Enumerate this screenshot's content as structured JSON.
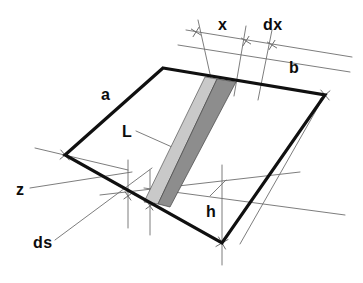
{
  "figure": {
    "kind": "geometry-diagram",
    "background_color": "#ffffff"
  },
  "colors": {
    "outline": "#101010",
    "guide_line": "#6e6e6e",
    "strip_light": "#c9c9c9",
    "strip_dark": "#8d8d8d",
    "label_text": "#0c0c0c"
  },
  "labels": [
    {
      "id": "x",
      "text": "x",
      "x": 218,
      "y": 17,
      "size": 16,
      "name": "label-x"
    },
    {
      "id": "dx",
      "text": "dx",
      "x": 263,
      "y": 17,
      "size": 16,
      "name": "label-dx"
    },
    {
      "id": "b",
      "text": "b",
      "x": 289,
      "y": 60,
      "size": 16,
      "name": "label-b"
    },
    {
      "id": "a",
      "text": "a",
      "x": 101,
      "y": 87,
      "size": 16,
      "name": "label-a"
    },
    {
      "id": "L",
      "text": "L",
      "x": 122,
      "y": 124,
      "size": 16,
      "name": "label-L"
    },
    {
      "id": "z",
      "text": "z",
      "x": 16,
      "y": 182,
      "size": 16,
      "name": "label-z"
    },
    {
      "id": "h",
      "text": "h",
      "x": 206,
      "y": 204,
      "size": 16,
      "name": "label-h"
    },
    {
      "id": "ds",
      "text": "ds",
      "x": 33,
      "y": 235,
      "size": 16,
      "name": "label-ds"
    }
  ],
  "geometry": {
    "parallelogram": {
      "name": "main-surface-parallelogram",
      "points": "163,68 325,95 222,243 65,155",
      "corners": {
        "top_left": [
          163,
          68
        ],
        "top_right": [
          325,
          95
        ],
        "bottom_right": [
          222,
          243
        ],
        "bottom_left": [
          65,
          155
        ]
      },
      "stroke_width": 3.2
    },
    "strip_light": {
      "name": "strip-light-band",
      "points": "205,77 217,79 158,204 144,202",
      "fill": "#c9c9c9"
    },
    "strip_dark": {
      "name": "strip-dark-band",
      "points": "217,79 236,82 170,207 158,204",
      "fill": "#8d8d8d"
    },
    "guide_lines": [
      {
        "name": "guide-top-ruler-left",
        "x1": 186,
        "y1": 30,
        "x2": 352,
        "y2": 57
      },
      {
        "name": "guide-top-ruler-right",
        "x1": 178,
        "y1": 45,
        "x2": 350,
        "y2": 72
      },
      {
        "name": "guide-measure-x",
        "x1": 198,
        "y1": 20,
        "x2": 214,
        "y2": 92
      },
      {
        "name": "guide-measure-dx-a",
        "x1": 246,
        "y1": 26,
        "x2": 234,
        "y2": 96
      },
      {
        "name": "guide-measure-dx-b",
        "x1": 272,
        "y1": 30,
        "x2": 258,
        "y2": 100
      },
      {
        "name": "guide-left-cross",
        "x1": 35,
        "y1": 148,
        "x2": 128,
        "y2": 170
      },
      {
        "name": "guide-z-leader",
        "x1": 30,
        "y1": 188,
        "x2": 132,
        "y2": 172
      },
      {
        "name": "guide-ds-leader",
        "x1": 55,
        "y1": 240,
        "x2": 152,
        "y2": 168
      },
      {
        "name": "guide-horizontal-base",
        "x1": 100,
        "y1": 195,
        "x2": 300,
        "y2": 172
      },
      {
        "name": "guide-base-extend",
        "x1": 144,
        "y1": 188,
        "x2": 345,
        "y2": 215
      },
      {
        "name": "guide-vertical-left",
        "x1": 128,
        "y1": 160,
        "x2": 128,
        "y2": 228
      },
      {
        "name": "guide-vertical-mid",
        "x1": 150,
        "y1": 170,
        "x2": 150,
        "y2": 235
      },
      {
        "name": "guide-vertical-h",
        "x1": 222,
        "y1": 165,
        "x2": 222,
        "y2": 265
      },
      {
        "name": "guide-diag-right",
        "x1": 240,
        "y1": 244,
        "x2": 322,
        "y2": 100
      },
      {
        "name": "guide-L-leader",
        "x1": 136,
        "y1": 131,
        "x2": 172,
        "y2": 147
      },
      {
        "name": "guide-h-leader",
        "x1": 210,
        "y1": 196,
        "x2": 226,
        "y2": 180
      }
    ],
    "tick_crosses": [
      {
        "name": "tick-top-left",
        "x": 196,
        "y": 32,
        "len": 11,
        "angle": -58
      },
      {
        "name": "tick-top-x",
        "x": 246,
        "y": 41,
        "len": 11,
        "angle": -58
      },
      {
        "name": "tick-top-dx",
        "x": 272,
        "y": 45,
        "len": 11,
        "angle": -58
      },
      {
        "name": "tick-corner-left",
        "x": 65,
        "y": 155,
        "len": 13,
        "angle": -40
      },
      {
        "name": "tick-corner-right",
        "x": 325,
        "y": 95,
        "len": 13,
        "angle": -40
      },
      {
        "name": "tick-corner-bot",
        "x": 222,
        "y": 243,
        "len": 14,
        "angle": -30
      },
      {
        "name": "tick-base-a",
        "x": 128,
        "y": 196,
        "len": 10,
        "angle": -35
      },
      {
        "name": "tick-base-b",
        "x": 150,
        "y": 206,
        "len": 10,
        "angle": -35
      }
    ]
  }
}
